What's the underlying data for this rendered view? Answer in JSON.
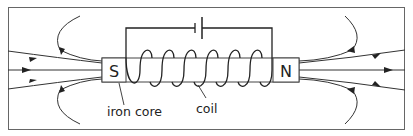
{
  "diagram": {
    "poles": {
      "left": "S",
      "right": "N"
    },
    "labels": {
      "core": "iron core",
      "coil": "coil"
    },
    "components": [
      "battery",
      "coil",
      "iron core",
      "field lines"
    ],
    "colors": {
      "line": "#333333",
      "frame": "#555555",
      "background": "#ffffff"
    }
  }
}
